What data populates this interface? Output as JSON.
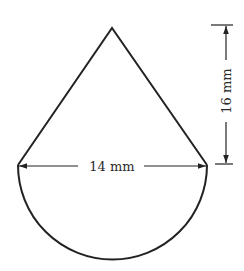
{
  "figure": {
    "shapes": {
      "triangle": {
        "apex": [
          112,
          28
        ],
        "base_left": [
          18,
          165
        ],
        "base_right": [
          207,
          165
        ]
      },
      "semicircle": {
        "center": [
          112.5,
          165
        ],
        "radius": 94.5,
        "direction": "down"
      }
    },
    "dimensions": {
      "width": {
        "label": "14 mm",
        "value": 14,
        "unit": "mm",
        "orientation": "horizontal"
      },
      "height": {
        "label": "16 mm",
        "value": 16,
        "unit": "mm",
        "orientation": "vertical"
      }
    },
    "colors": {
      "stroke": "#222222",
      "background": "#ffffff"
    }
  }
}
